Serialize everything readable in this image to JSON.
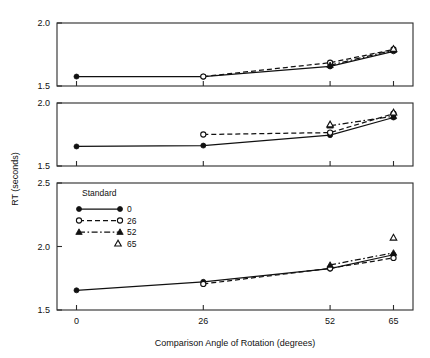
{
  "figure": {
    "background": "#ffffff",
    "ink_color": "#111111"
  },
  "axes": {
    "x_title": "Comparison Angle of Rotation (degrees)",
    "y_title": "RT (seconds)",
    "x_ticks": [
      "0",
      "26",
      "52",
      "65"
    ],
    "x_values": [
      0,
      26,
      52,
      65
    ],
    "panel_top_yticks": [
      "1.5",
      "2.0"
    ],
    "panel_middle_yticks": [
      "1.5",
      "2.0"
    ],
    "panel_bottom_yticks": [
      "1.5",
      "2.0",
      "2.5"
    ]
  },
  "legend": {
    "title": "Standard",
    "entries": [
      {
        "label": "0",
        "marker": "filled-circle",
        "line": "solid"
      },
      {
        "label": "26",
        "marker": "open-circle",
        "line": "dashed"
      },
      {
        "label": "52",
        "marker": "filled-triangle",
        "line": "dash-dot"
      },
      {
        "label": "65",
        "marker": "open-triangle",
        "line": "none"
      }
    ]
  },
  "chart_data": {
    "type": "line",
    "title": "",
    "xlabel": "Comparison Angle of Rotation (degrees)",
    "ylabel": "RT (seconds)",
    "x": [
      0,
      26,
      52,
      65
    ],
    "xlim": [
      -4,
      69
    ],
    "panels": [
      {
        "name": "top-panel",
        "ylim": [
          1.5,
          2.0
        ],
        "yticks": [
          1.5,
          2.0
        ],
        "series": [
          {
            "name": "0",
            "marker": "filled-circle",
            "line": "solid",
            "x": [
              0,
              26,
              52,
              65
            ],
            "values": [
              1.575,
              1.575,
              1.655,
              1.775
            ]
          },
          {
            "name": "26",
            "marker": "open-circle",
            "line": "dashed",
            "x": [
              26,
              52,
              65
            ],
            "values": [
              1.575,
              1.685,
              1.79
            ]
          },
          {
            "name": "52",
            "marker": "filled-triangle",
            "line": "dash-dot",
            "x": [
              52,
              65
            ],
            "values": [
              1.665,
              1.785
            ]
          },
          {
            "name": "65",
            "marker": "open-triangle",
            "line": "none",
            "x": [
              65
            ],
            "values": [
              1.795
            ]
          }
        ]
      },
      {
        "name": "middle-panel",
        "ylim": [
          1.5,
          2.0
        ],
        "yticks": [
          1.5,
          2.0
        ],
        "series": [
          {
            "name": "0",
            "marker": "filled-circle",
            "line": "solid",
            "x": [
              0,
              26,
              52,
              65
            ],
            "values": [
              1.655,
              1.662,
              1.745,
              1.885
            ]
          },
          {
            "name": "26",
            "marker": "open-circle",
            "line": "dashed",
            "x": [
              26,
              52,
              65
            ],
            "values": [
              1.75,
              1.765,
              1.915
            ]
          },
          {
            "name": "52",
            "marker": "filled-triangle",
            "line": "dash-dot",
            "x": [
              52,
              65
            ],
            "values": [
              1.82,
              1.895
            ]
          },
          {
            "name": "65",
            "marker": "open-triangle",
            "line": "none",
            "x": [
              52,
              65
            ],
            "values": [
              1.83,
              1.925
            ]
          }
        ]
      },
      {
        "name": "bottom-panel",
        "ylim": [
          1.5,
          2.5
        ],
        "yticks": [
          1.5,
          2.0,
          2.5
        ],
        "series": [
          {
            "name": "0",
            "marker": "filled-circle",
            "line": "solid",
            "x": [
              0,
              26,
              52,
              65
            ],
            "values": [
              1.655,
              1.722,
              1.825,
              1.935
            ]
          },
          {
            "name": "26",
            "marker": "open-circle",
            "line": "dashed",
            "x": [
              26,
              52,
              65
            ],
            "values": [
              1.705,
              1.828,
              1.91
            ]
          },
          {
            "name": "52",
            "marker": "filled-triangle",
            "line": "dash-dot",
            "x": [
              52,
              65
            ],
            "values": [
              1.855,
              1.95
            ]
          },
          {
            "name": "65",
            "marker": "open-triangle",
            "line": "none",
            "x": [
              65
            ],
            "values": [
              2.07
            ]
          }
        ]
      }
    ],
    "grid": false,
    "legend_position": "inside-bottom-panel-upper-left"
  }
}
